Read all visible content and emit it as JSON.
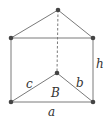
{
  "diagram": {
    "type": "triangular-prism",
    "vertices": {
      "top_back": [
        58,
        10
      ],
      "top_left": [
        11,
        38
      ],
      "top_right": [
        93,
        38
      ],
      "bottom_back": [
        57,
        73
      ],
      "bottom_left": [
        11,
        102
      ],
      "bottom_right": [
        93,
        102
      ]
    },
    "labels": {
      "a": "a",
      "b": "b",
      "c": "c",
      "B": "B",
      "h": "h"
    },
    "colors": {
      "edge": "#7a7a7a",
      "vertex": "#444444",
      "label": "#333333"
    }
  }
}
